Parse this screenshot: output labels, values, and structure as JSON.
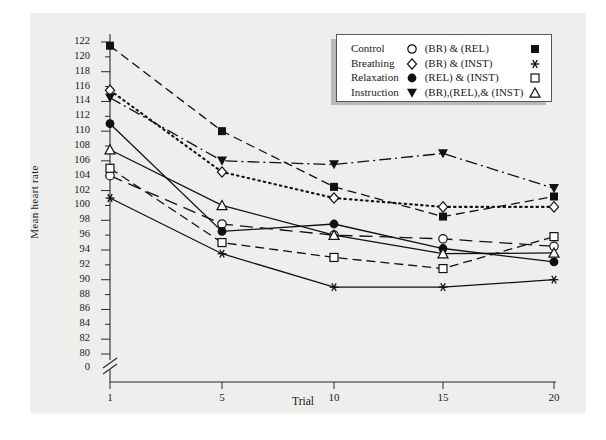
{
  "figure": {
    "background": "#eeeeec",
    "frame_color": "#58585a"
  },
  "axes": {
    "ylabel": "Mean heart rate",
    "xlabel": "Trial",
    "y_ticks": [
      122,
      120,
      118,
      116,
      114,
      112,
      110,
      108,
      106,
      104,
      102,
      100,
      98,
      96,
      94,
      92,
      90,
      88,
      86,
      84,
      82,
      80
    ],
    "y_break_tick": "0",
    "x_ticks": [
      "1",
      "5",
      "10",
      "15",
      "20"
    ]
  },
  "legend": {
    "rows": [
      {
        "left_label": "Control",
        "left_marker": "open-circle",
        "right_label": "(BR) & (REL)",
        "right_marker": "filled-square"
      },
      {
        "left_label": "Breathing",
        "left_marker": "open-diamond",
        "right_label": "(BR) & (INST)",
        "right_marker": "asterisk"
      },
      {
        "left_label": "Relaxation",
        "left_marker": "filled-circle",
        "right_label": "(REL) & (INST)",
        "right_marker": "open-square"
      },
      {
        "left_label": "Instruction",
        "left_marker": "filled-triangle-down",
        "right_label": "(BR),(REL),& (INST)",
        "right_marker": "open-triangle-up"
      }
    ]
  },
  "chart_data": {
    "type": "line",
    "title": "",
    "xlabel": "Trial",
    "ylabel": "Mean heart rate",
    "x": [
      1,
      5,
      10,
      15,
      20
    ],
    "xlim": [
      1,
      20
    ],
    "ylim": [
      80,
      122
    ],
    "y_axis_break_at_zero": true,
    "grid": false,
    "legend_position": "top-right",
    "series": [
      {
        "name": "Control",
        "marker": "open-circle",
        "line": "long-dash",
        "values": [
          104.0,
          97.5,
          96.0,
          95.5,
          94.5
        ]
      },
      {
        "name": "Breathing",
        "marker": "open-diamond",
        "line": "dotted",
        "values": [
          115.5,
          104.5,
          101.0,
          99.8,
          99.8
        ]
      },
      {
        "name": "Relaxation",
        "marker": "filled-circle",
        "line": "solid",
        "values": [
          111.0,
          96.5,
          97.5,
          94.2,
          92.4
        ]
      },
      {
        "name": "Instruction",
        "marker": "filled-triangle-down",
        "line": "dash-dot",
        "values": [
          114.5,
          106.0,
          105.5,
          107.0,
          102.3
        ]
      },
      {
        "name": "(BR) & (REL)",
        "marker": "filled-square",
        "line": "dashed",
        "values": [
          121.5,
          110.0,
          102.5,
          98.5,
          101.2
        ]
      },
      {
        "name": "(BR) & (INST)",
        "marker": "asterisk",
        "line": "solid",
        "values": [
          101.0,
          93.5,
          89.0,
          89.0,
          90.0
        ]
      },
      {
        "name": "(REL) & (INST)",
        "marker": "open-square",
        "line": "dashed",
        "values": [
          105.0,
          95.0,
          93.0,
          91.5,
          95.8
        ]
      },
      {
        "name": "(BR),(REL),& (INST)",
        "marker": "open-triangle-up",
        "line": "solid",
        "values": [
          107.5,
          100.0,
          96.0,
          93.5,
          93.6
        ]
      }
    ]
  }
}
